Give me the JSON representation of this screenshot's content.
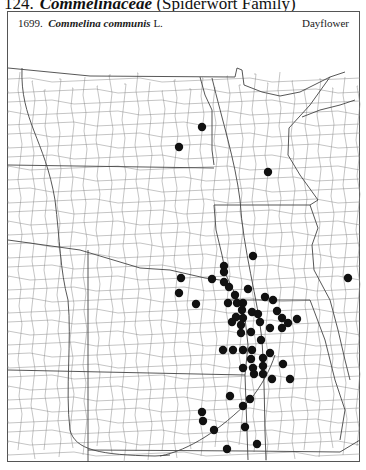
{
  "heading": {
    "number": "124.",
    "family_latin": "Commelinaceae",
    "family_common": "(Spiderwort Family)"
  },
  "species": {
    "number": "1699.",
    "name_latin": "Commelina communis",
    "author": "L.",
    "common_name": "Dayflower"
  },
  "map": {
    "dot_color": "#111111",
    "line_color": "#8a8a8a",
    "state_line_color": "#3a3a3a",
    "dots": [
      [
        202,
        127
      ],
      [
        179,
        147
      ],
      [
        268,
        172
      ],
      [
        348,
        278
      ],
      [
        253,
        256
      ],
      [
        224,
        266
      ],
      [
        224,
        272
      ],
      [
        181,
        278
      ],
      [
        212,
        279
      ],
      [
        224,
        282
      ],
      [
        229,
        287
      ],
      [
        248,
        289
      ],
      [
        179,
        293
      ],
      [
        235,
        295
      ],
      [
        265,
        297
      ],
      [
        273,
        300
      ],
      [
        196,
        304
      ],
      [
        228,
        303
      ],
      [
        237,
        303
      ],
      [
        243,
        303
      ],
      [
        242,
        310
      ],
      [
        252,
        312
      ],
      [
        258,
        314
      ],
      [
        277,
        311
      ],
      [
        236,
        317
      ],
      [
        243,
        318
      ],
      [
        282,
        318
      ],
      [
        297,
        319
      ],
      [
        232,
        322
      ],
      [
        260,
        322
      ],
      [
        288,
        323
      ],
      [
        241,
        325
      ],
      [
        282,
        328
      ],
      [
        270,
        328
      ],
      [
        241,
        333
      ],
      [
        251,
        332
      ],
      [
        261,
        340
      ],
      [
        223,
        350
      ],
      [
        233,
        350
      ],
      [
        243,
        350
      ],
      [
        252,
        350
      ],
      [
        270,
        353
      ],
      [
        263,
        358
      ],
      [
        251,
        359
      ],
      [
        283,
        364
      ],
      [
        243,
        368
      ],
      [
        253,
        368
      ],
      [
        263,
        366
      ],
      [
        254,
        374
      ],
      [
        263,
        374
      ],
      [
        272,
        379
      ],
      [
        290,
        379
      ],
      [
        230,
        396
      ],
      [
        250,
        399
      ],
      [
        243,
        406
      ],
      [
        202,
        412
      ],
      [
        203,
        421
      ],
      [
        214,
        430
      ],
      [
        245,
        427
      ],
      [
        257,
        444
      ],
      [
        227,
        449
      ]
    ]
  }
}
